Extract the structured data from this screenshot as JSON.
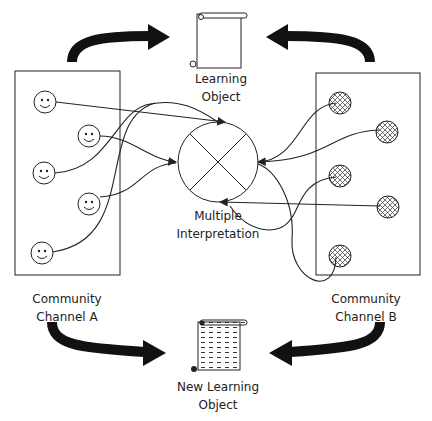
{
  "diagram": {
    "top_object": {
      "line1": "Learning",
      "line2": "Object",
      "icon": "scroll-icon"
    },
    "bottom_object": {
      "line1": "New Learning",
      "line2": "Object",
      "icon": "scroll-filled-icon"
    },
    "center": {
      "line1": "Multiple",
      "line2": "Interpretation",
      "icon": "circle-cross-icon"
    },
    "channel_a": {
      "line1": "Community",
      "line2": "Channel A",
      "members": 5,
      "member_icon": "smiley-icon"
    },
    "channel_b": {
      "line1": "Community",
      "line2": "Channel B",
      "members": 5,
      "member_icon": "hatched-smiley-icon"
    },
    "arrows": [
      {
        "from": "Community Channel A",
        "to": "Learning Object"
      },
      {
        "from": "Community Channel B",
        "to": "Learning Object"
      },
      {
        "from": "Community Channel A",
        "to": "New Learning Object"
      },
      {
        "from": "Community Channel B",
        "to": "New Learning Object"
      }
    ],
    "colors": {
      "stroke": "#222222",
      "background": "#ffffff"
    }
  }
}
